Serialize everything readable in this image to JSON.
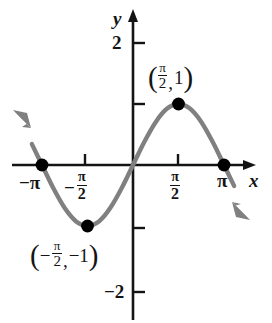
{
  "figure": {
    "type": "graph",
    "background_color": "#ffffff",
    "curve_color": "#808080",
    "axis_color": "#141414",
    "point_color": "#000000"
  },
  "axes": {
    "x_axis_label": "x",
    "y_axis_label": "y",
    "x_ticks": [
      {
        "label_parts": {
          "sign": "−",
          "symbol": "π"
        },
        "value": -3.1416,
        "px": 38
      },
      {
        "label_parts": {
          "sign": "−",
          "numerator": "π",
          "denominator": "2"
        },
        "value": -1.5708,
        "px": 85
      },
      {
        "label_parts": {
          "sign": "",
          "numerator": "π",
          "denominator": "2"
        },
        "value": 1.5708,
        "px": 178
      },
      {
        "label_parts": {
          "sign": "",
          "symbol": "π"
        },
        "value": 3.1416,
        "px": 224
      }
    ],
    "y_ticks": [
      {
        "label": "2",
        "value": 2,
        "px": 43
      },
      {
        "label": "",
        "value": 1,
        "px": 104
      },
      {
        "label": "",
        "value": -1,
        "px": 228
      },
      {
        "label": "−2",
        "value": -2,
        "px": 292
      }
    ],
    "origin_px": {
      "x": 133,
      "y": 165
    },
    "x_range": [
      -3.6,
      3.6
    ],
    "y_range": [
      -2.45,
      2.45
    ]
  },
  "point_labels": [
    {
      "id": "max-point-label",
      "open_paren": "(",
      "x_numerator": "π",
      "x_denominator": "2",
      "comma": ",",
      "y_value": "1",
      "close_paren": ")",
      "point_value": {
        "x": 1.5708,
        "y": 1
      }
    },
    {
      "id": "min-point-label",
      "open_paren": "(",
      "x_sign": "−",
      "x_numerator": "π",
      "x_denominator": "2",
      "comma": ",",
      "y_sign": "−",
      "y_value": "1",
      "close_paren": ")",
      "point_value": {
        "x": -1.5708,
        "y": -1
      }
    }
  ],
  "chart_data": {
    "type": "line",
    "title": "",
    "xlabel": "x",
    "ylabel": "y",
    "function": "y = sin(x)",
    "xlim": [
      -3.6,
      3.6
    ],
    "ylim": [
      -2.45,
      2.45
    ],
    "grid": false,
    "legend": null,
    "xticks": [
      -3.1416,
      -1.5708,
      1.5708,
      3.1416
    ],
    "xticklabels": [
      "−π",
      "−π/2",
      "π/2",
      "π"
    ],
    "yticks": [
      -2,
      -1,
      1,
      2
    ],
    "yticklabels": [
      "−2",
      "",
      "",
      "2"
    ],
    "series": [
      {
        "name": "y = sin x",
        "color": "#808080",
        "x": [
          -3.4907,
          -3.1416,
          -2.7489,
          -2.3562,
          -1.9635,
          -1.5708,
          -1.1781,
          -0.7854,
          -0.3927,
          0,
          0.3927,
          0.7854,
          1.1781,
          1.5708,
          1.9635,
          2.3562,
          2.7489,
          3.1416,
          3.4907
        ],
        "y": [
          0.342,
          0,
          -0.3827,
          -0.7071,
          -0.9239,
          -1,
          -0.9239,
          -0.7071,
          -0.3827,
          0,
          0.3827,
          0.7071,
          0.9239,
          1,
          0.9239,
          0.7071,
          0.3827,
          0,
          -0.342
        ],
        "arrow_start": true,
        "arrow_end": true
      }
    ],
    "annotations": [
      {
        "text": "(π/2, 1)",
        "x": 1.5708,
        "y": 1,
        "marker": true
      },
      {
        "text": "(−π/2, −1)",
        "x": -1.5708,
        "y": -1,
        "marker": true
      },
      {
        "text": "",
        "x": -3.1416,
        "y": 0,
        "marker": true
      },
      {
        "text": "",
        "x": 3.1416,
        "y": 0,
        "marker": true
      }
    ],
    "marked_points": [
      {
        "x": -3.1416,
        "y": 0
      },
      {
        "x": -1.5708,
        "y": -1
      },
      {
        "x": 1.5708,
        "y": 1
      },
      {
        "x": 3.1416,
        "y": 0
      }
    ]
  }
}
